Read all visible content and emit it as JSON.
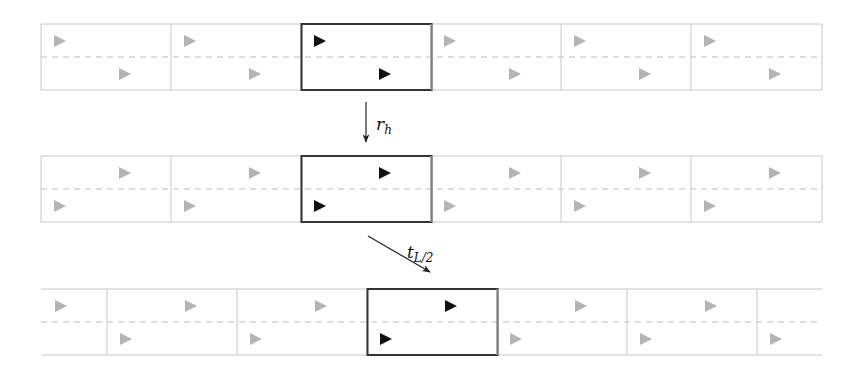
{
  "colors": {
    "grid_line": "#c8c8c8",
    "dash_line": "#bdbdbd",
    "faded_triangle": "#b4b4b4",
    "highlight_triangle": "#111111",
    "highlight_box": "#333333",
    "arrow": "#222222"
  },
  "cell_width": 130,
  "rows": [
    {
      "name": "original-strip",
      "y_top": 24,
      "y_bottom": 90,
      "x_start": 41,
      "x_end": 822,
      "closed_left": true,
      "closed_right": true,
      "cell_starts": [
        41,
        171,
        301,
        431,
        561,
        691
      ],
      "highlight_cell": 2,
      "top_triangle_offset": 13,
      "bottom_triangle_offset": 78
    },
    {
      "name": "reflected-strip",
      "y_top": 156,
      "y_bottom": 222,
      "x_start": 41,
      "x_end": 822,
      "closed_left": true,
      "closed_right": true,
      "cell_starts": [
        41,
        171,
        301,
        431,
        561,
        691
      ],
      "highlight_cell": 2,
      "top_triangle_offset": 78,
      "bottom_triangle_offset": 13
    },
    {
      "name": "translated-strip",
      "y_top": 289,
      "y_bottom": 355,
      "x_start": 41,
      "x_end": 822,
      "closed_left": false,
      "closed_right": false,
      "cell_starts": [
        -23,
        107,
        237,
        367,
        497,
        627,
        757
      ],
      "highlight_cell": 3,
      "top_triangle_offset": 78,
      "bottom_triangle_offset": 13
    }
  ],
  "arrows": [
    {
      "name": "reflection-arrow",
      "label_main": "r",
      "label_sub": "h",
      "x1": 366,
      "y1": 102,
      "x2": 366,
      "y2": 142,
      "label_x": 376,
      "label_y": 130
    },
    {
      "name": "translation-arrow",
      "label_main": "t",
      "label_sub": "L/2",
      "x1": 368,
      "y1": 236,
      "x2": 430,
      "y2": 272,
      "label_x": 407,
      "label_y": 258
    }
  ]
}
